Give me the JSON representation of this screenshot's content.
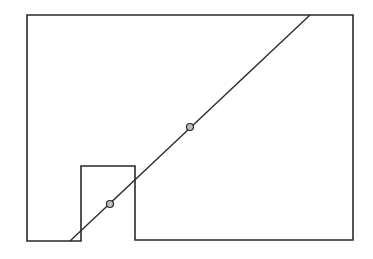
{
  "diagram": {
    "type": "geometric-figure",
    "stroke_color": "#2a2a2a",
    "point_fill": "#bdbdbd",
    "outline_polygon": [
      [
        27,
        15
      ],
      [
        353,
        15
      ],
      [
        353,
        240
      ],
      [
        135,
        240
      ],
      [
        135,
        166
      ],
      [
        81,
        166
      ],
      [
        81,
        241
      ],
      [
        27,
        241
      ]
    ],
    "line": {
      "x1": 70,
      "y1": 241,
      "x2": 310,
      "y2": 15
    },
    "points": [
      {
        "name": "lower-point",
        "cx": 110,
        "cy": 204,
        "r": 3.5
      },
      {
        "name": "upper-point",
        "cx": 190,
        "cy": 127,
        "r": 3.5
      }
    ]
  }
}
